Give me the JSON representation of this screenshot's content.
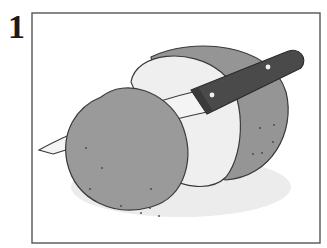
{
  "step": {
    "number": "1"
  },
  "illustration": {
    "subject": "potato being sliced with a paring knife",
    "colors": {
      "potato_skin": "#9a9a9a",
      "potato_skin_dark": "#8c8c8c",
      "potato_flesh": "#efefef",
      "knife_handle": "#4a4a4a",
      "knife_blade": "#f4f4f4",
      "outline": "#3a3a3a",
      "frame": "#555555"
    }
  }
}
